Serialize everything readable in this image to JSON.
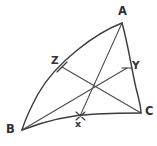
{
  "figure": {
    "width": 157,
    "height": 146,
    "background_color": "#ffffff",
    "arc_stroke_color": "#3b3b43",
    "cevian_stroke_color": "#4a4a52",
    "label_color": "#2e2e36",
    "style": "hand-drawn pencil sketch"
  },
  "vertices": [
    {
      "id": "A",
      "label": "A",
      "x": 122,
      "y": 23,
      "label_x": 118,
      "label_y": 6
    },
    {
      "id": "B",
      "label": "B",
      "x": 22,
      "y": 130,
      "label_x": 6,
      "label_y": 124
    },
    {
      "id": "C",
      "label": "C",
      "x": 141,
      "y": 113,
      "label_x": 145,
      "label_y": 106
    }
  ],
  "side_points": [
    {
      "id": "Z",
      "label": "Z",
      "x": 62,
      "y": 67,
      "label_x": 51,
      "label_y": 55,
      "on_side": "AB"
    },
    {
      "id": "Y",
      "label": "Y",
      "x": 127,
      "y": 68,
      "label_x": 132,
      "label_y": 60,
      "on_side": "AC"
    },
    {
      "id": "x",
      "label": "x",
      "x": 80,
      "y": 116,
      "label_x": 75,
      "label_y": 119,
      "on_side": "BC"
    }
  ],
  "concurrency_point": {
    "id": "P",
    "x": 100,
    "y": 84
  },
  "arcs": [
    {
      "id": "arc-AB",
      "from": "A",
      "to": "B",
      "bulge": "outward-upper-left",
      "path": "M 122 23 C 96 33, 56 62, 38 94 C 31 107, 25 120, 22 130"
    },
    {
      "id": "arc-BC",
      "from": "B",
      "to": "C",
      "bulge": "outward-downward",
      "path": "M 22 130 C 45 121, 72 115, 96 114 C 118 113, 134 113, 141 113"
    },
    {
      "id": "arc-AC",
      "from": "A",
      "to": "C",
      "bulge": "outward-right",
      "path": "M 122 23 C 128 44, 131 66, 136 88 C 139 99, 141 108, 141 113"
    }
  ],
  "cevians": [
    {
      "id": "cevian-A-x",
      "from": "A",
      "to": "x",
      "path": "M 122 23 L 80 116"
    },
    {
      "id": "cevian-B-Y",
      "from": "B",
      "to": "Y",
      "path": "M 22 130 L 127 68"
    },
    {
      "id": "cevian-C-Z",
      "from": "C",
      "to": "Z",
      "path": "M 141 113 L 62 67"
    }
  ],
  "tick_marks": [
    {
      "id": "tick-Z",
      "path": "M 57 72 L 67 62"
    },
    {
      "id": "tick-Y",
      "path": "M 122 68 L 132 68"
    },
    {
      "id": "tick-x",
      "path": "M 76 112 L 85 120 M 85 112 L 76 120"
    }
  ]
}
